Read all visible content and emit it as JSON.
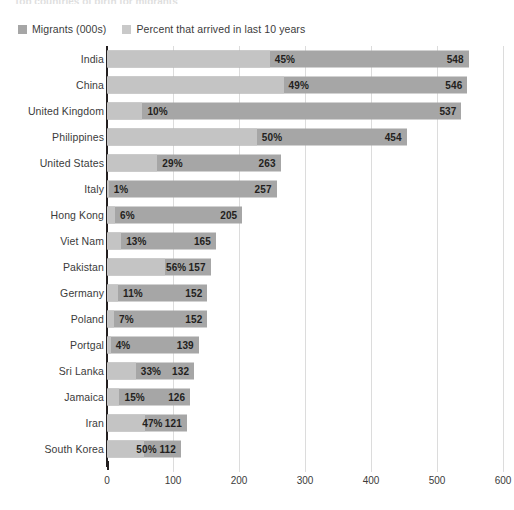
{
  "chart_title": "Top countries of birth for migrants",
  "legend": {
    "items": [
      {
        "label": "Migrants (000s)",
        "color": "#a6a6a6",
        "icon": "legend-swatch-icon"
      },
      {
        "label": "Percent that arrived in last 10 years",
        "color": "#c9c9c9",
        "icon": "legend-swatch-icon"
      }
    ]
  },
  "axis": {
    "x_ticks": [
      "0",
      "100",
      "200",
      "300",
      "400",
      "500",
      "600"
    ]
  },
  "colors": {
    "bar_total": "#a6a6a6",
    "bar_percent": "#c4c4c4",
    "gridline": "#dcdcdc",
    "axis": "#231f20",
    "text": "#3b3b3b"
  },
  "chart_data": {
    "type": "bar",
    "orientation": "horizontal",
    "title": "Top countries of birth for migrants",
    "xlabel": "",
    "ylabel": "",
    "xlim": [
      0,
      600
    ],
    "grid": true,
    "legend_position": "top-left",
    "categories": [
      "India",
      "China",
      "United Kingdom",
      "Philippines",
      "United States",
      "Italy",
      "Hong Kong",
      "Viet Nam",
      "Pakistan",
      "Germany",
      "Poland",
      "Portgal",
      "Sri Lanka",
      "Jamaica",
      "Iran",
      "South Korea"
    ],
    "series": [
      {
        "name": "Migrants (000s)",
        "values": [
          548,
          546,
          537,
          454,
          263,
          257,
          205,
          165,
          157,
          152,
          152,
          139,
          132,
          126,
          121,
          112
        ]
      },
      {
        "name": "Percent that arrived in last 10 years",
        "values": [
          45,
          49,
          10,
          50,
          29,
          1,
          6,
          13,
          56,
          11,
          7,
          4,
          33,
          15,
          47,
          50
        ],
        "unit": "%"
      }
    ],
    "rows": [
      {
        "category": "India",
        "value": 548,
        "value_label": "548",
        "percent": 45,
        "percent_label": "45%"
      },
      {
        "category": "China",
        "value": 546,
        "value_label": "546",
        "percent": 49,
        "percent_label": "49%"
      },
      {
        "category": "United Kingdom",
        "value": 537,
        "value_label": "537",
        "percent": 10,
        "percent_label": "10%"
      },
      {
        "category": "Philippines",
        "value": 454,
        "value_label": "454",
        "percent": 50,
        "percent_label": "50%"
      },
      {
        "category": "United States",
        "value": 263,
        "value_label": "263",
        "percent": 29,
        "percent_label": "29%"
      },
      {
        "category": "Italy",
        "value": 257,
        "value_label": "257",
        "percent": 1,
        "percent_label": "1%"
      },
      {
        "category": "Hong Kong",
        "value": 205,
        "value_label": "205",
        "percent": 6,
        "percent_label": "6%"
      },
      {
        "category": "Viet Nam",
        "value": 165,
        "value_label": "165",
        "percent": 13,
        "percent_label": "13%"
      },
      {
        "category": "Pakistan",
        "value": 157,
        "value_label": "157",
        "percent": 56,
        "percent_label": "56%"
      },
      {
        "category": "Germany",
        "value": 152,
        "value_label": "152",
        "percent": 11,
        "percent_label": "11%"
      },
      {
        "category": "Poland",
        "value": 152,
        "value_label": "152",
        "percent": 7,
        "percent_label": "7%"
      },
      {
        "category": "Portgal",
        "value": 139,
        "value_label": "139",
        "percent": 4,
        "percent_label": "4%"
      },
      {
        "category": "Sri Lanka",
        "value": 132,
        "value_label": "132",
        "percent": 33,
        "percent_label": "33%"
      },
      {
        "category": "Jamaica",
        "value": 126,
        "value_label": "126",
        "percent": 15,
        "percent_label": "15%"
      },
      {
        "category": "Iran",
        "value": 121,
        "value_label": "121",
        "percent": 47,
        "percent_label": "47%"
      },
      {
        "category": "South Korea",
        "value": 112,
        "value_label": "112",
        "percent": 50,
        "percent_label": "50%"
      }
    ]
  }
}
